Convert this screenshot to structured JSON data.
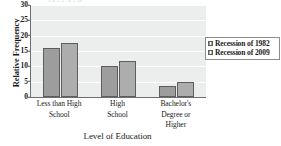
{
  "chart_data": {
    "type": "bar",
    "title": "",
    "subtitle": "",
    "xlabel": "Level of Education",
    "ylabel": "Relative Frequency",
    "categories": [
      "Less than High School",
      "High School",
      "Bachelor's Degree or Higher"
    ],
    "series": [
      {
        "name": "Recession of 1982",
        "values": [
          16,
          10,
          3.7
        ],
        "color": "#9d9d9d"
      },
      {
        "name": "Recession of 2009",
        "values": [
          17.7,
          11.7,
          5.0
        ],
        "color": "#adadad"
      }
    ],
    "ylim": [
      0,
      30
    ],
    "yticks": [
      0,
      5,
      10,
      15,
      20,
      25,
      30
    ],
    "ytick_labels": [
      "0",
      "5",
      "10",
      "15",
      "20",
      "25",
      "30"
    ],
    "grid": true,
    "grid_axis": "y",
    "legend": {
      "position": "right",
      "entries": [
        "Recession of 1982",
        "Recession of 2009"
      ]
    },
    "plot_background": "#eceded",
    "gridline_color": "#fdfdfd",
    "axis_color": "#6e6e6e"
  },
  "axis": {
    "y_title": "Relative Frequency",
    "x_title": "Level of Education"
  },
  "category_labels": [
    "Less than High\nSchool",
    "High\nSchool",
    "Bachelor's\nDegree or\nHigher"
  ],
  "icons": {
    "legend_swatch_1": "legend-swatch-icon",
    "legend_swatch_2": "legend-swatch-icon"
  }
}
